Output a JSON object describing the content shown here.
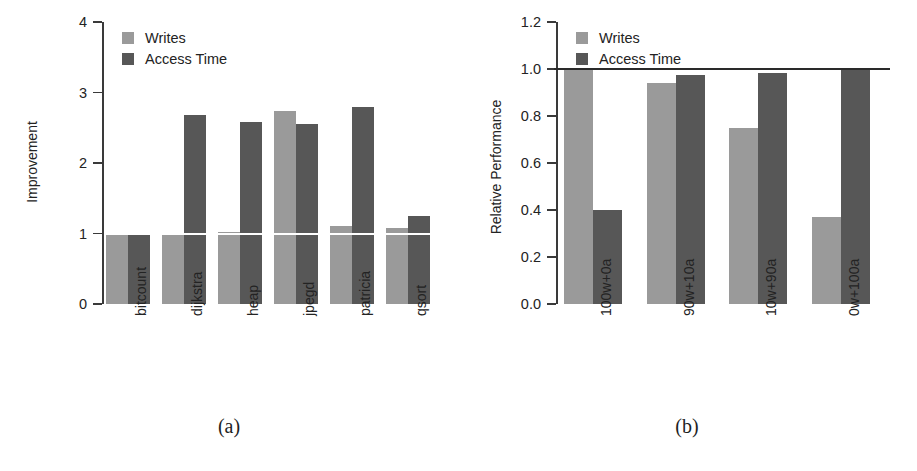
{
  "figure": {
    "panels": [
      {
        "id": "panel-a",
        "caption": "(a)",
        "legend": [
          {
            "label": "Writes",
            "color": "#9a9a9a",
            "key": "writes"
          },
          {
            "label": "Access Time",
            "color": "#575757",
            "key": "access"
          }
        ],
        "chart_data": {
          "type": "bar",
          "title": "",
          "xlabel": "",
          "ylabel": "Improvement",
          "ylim": [
            0,
            4
          ],
          "yticks": [
            0,
            1,
            2,
            3,
            4
          ],
          "ytick_labels": [
            "0",
            "1",
            "2",
            "3",
            "4"
          ],
          "grid": false,
          "legend_position": "top-left",
          "reference_line": {
            "y": 1.0,
            "color": "#ffffff"
          },
          "categories": [
            "bitcount",
            "dijkstra",
            "heap",
            "jpegd",
            "patricia",
            "qsort"
          ],
          "series": [
            {
              "name": "Writes",
              "color": "#9a9a9a",
              "values": [
                1.0,
                1.0,
                1.02,
                2.74,
                1.1,
                1.08
              ]
            },
            {
              "name": "Access Time",
              "color": "#575757",
              "values": [
                1.0,
                2.68,
                2.58,
                2.55,
                2.8,
                1.25
              ]
            }
          ]
        }
      },
      {
        "id": "panel-b",
        "caption": "(b)",
        "legend": [
          {
            "label": "Writes",
            "color": "#9a9a9a",
            "key": "writes"
          },
          {
            "label": "Access Time",
            "color": "#575757",
            "key": "access"
          }
        ],
        "chart_data": {
          "type": "bar",
          "title": "",
          "xlabel": "",
          "ylabel": "Relative Performance",
          "ylim": [
            0,
            1.2
          ],
          "yticks": [
            0.0,
            0.2,
            0.4,
            0.6,
            0.8,
            1.0,
            1.2
          ],
          "ytick_labels": [
            "0.0",
            "0.2",
            "0.4",
            "0.6",
            "0.8",
            "1.0",
            "1.2"
          ],
          "grid": false,
          "legend_position": "top-left",
          "reference_line": {
            "y": 1.0,
            "color": "#2a2a2a"
          },
          "categories": [
            "100w+0a",
            "90w+10a",
            "10w+90a",
            "0w+100a"
          ],
          "series": [
            {
              "name": "Writes",
              "color": "#9a9a9a",
              "values": [
                1.0,
                0.94,
                0.75,
                0.37
              ]
            },
            {
              "name": "Access Time",
              "color": "#575757",
              "values": [
                0.4,
                0.975,
                0.985,
                1.0
              ]
            }
          ]
        }
      }
    ]
  }
}
